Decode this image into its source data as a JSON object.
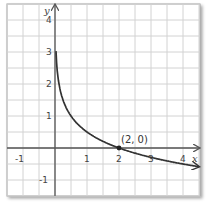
{
  "chart_data": {
    "type": "line",
    "title": "",
    "xlabel": "x",
    "ylabel": "y",
    "xlim": [
      -1.5,
      4.5
    ],
    "ylim": [
      -1.5,
      4.5
    ],
    "grid": true,
    "grid_step": 0.5,
    "x_ticks": [
      "-1",
      "1",
      "2",
      "3",
      "4"
    ],
    "y_ticks": [
      "4",
      "3",
      "2",
      "1",
      "-1"
    ],
    "series": [
      {
        "name": "y = log_{1/4}(x/2)",
        "x": [
          0.03,
          0.0625,
          0.125,
          0.25,
          0.5,
          1,
          2,
          3,
          4,
          4.5
        ],
        "y": [
          3.02,
          2.5,
          2.0,
          1.5,
          1.0,
          0.5,
          0.0,
          -0.29,
          -0.5,
          -0.58
        ]
      }
    ],
    "annotations": [
      {
        "text": "(2, 0)",
        "x": 2,
        "y": 0
      }
    ],
    "colors": {
      "curve": "#333333",
      "grid": "#cccccc",
      "axis": "#555555"
    }
  }
}
